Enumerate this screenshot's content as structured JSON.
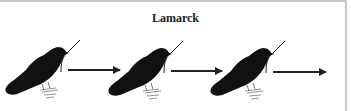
{
  "diagram": {
    "title": "Lamarck",
    "stages": [
      {
        "icon": "bird-with-twig-icon",
        "label": "generation-1"
      },
      {
        "icon": "bird-with-twig-icon",
        "label": "generation-2"
      },
      {
        "icon": "bird-with-twig-icon",
        "label": "generation-3"
      }
    ],
    "arrows": 3,
    "colors": {
      "ink": "#111111",
      "border": "#c8c8c8",
      "background": "#ffffff"
    }
  }
}
